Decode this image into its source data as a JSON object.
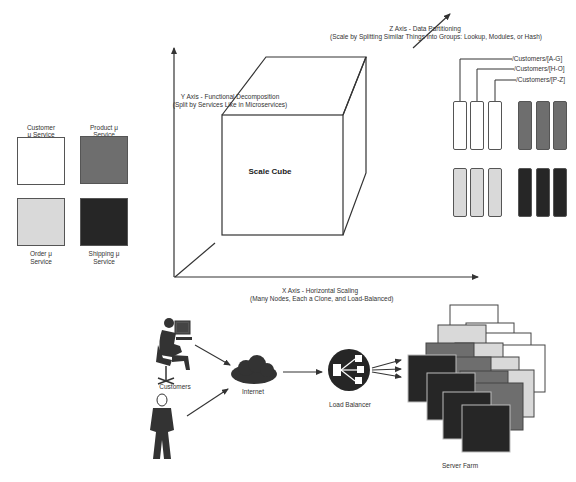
{
  "diagram": {
    "title": "Scale Cube",
    "axes": {
      "y": {
        "title": "Y Axis - Functional Decomposition",
        "subtitle": "(Split by Services Like in Microservices)"
      },
      "x": {
        "title": "X Axis - Horizontal Scaling",
        "subtitle": "(Many Nodes, Each a Clone, and Load-Balanced)"
      },
      "z": {
        "title": "Z Axis - Data Partitioning",
        "subtitle": "(Scale by Splitting Similar Things into Groups: Lookup, Modules, or Hash)"
      }
    },
    "services": [
      {
        "label_line1": "Customer",
        "label_line2": "μ Service",
        "color": "#ffffff"
      },
      {
        "label_line1": "Product μ",
        "label_line2": "Service",
        "color": "#6e6e6e"
      },
      {
        "label_line1": "Order μ",
        "label_line2": "Service",
        "color": "#d9d9d9"
      },
      {
        "label_line1": "Shipping μ",
        "label_line2": "Service",
        "color": "#262626"
      }
    ],
    "partitions": {
      "labels": [
        "/Customers/[A-G]",
        "/Customers/[H-O]",
        "/Customers/[P-Z]"
      ],
      "groups": [
        {
          "color": "#ffffff"
        },
        {
          "color": "#6e6e6e"
        },
        {
          "color": "#d9d9d9"
        },
        {
          "color": "#262626"
        }
      ]
    },
    "flow": {
      "customers_label": "Customers",
      "internet_label": "Internet",
      "load_balancer_label": "Load Balancer",
      "server_farm_label": "Server Farm"
    },
    "colors": {
      "line": "#333333",
      "white": "#ffffff",
      "light": "#d9d9d9",
      "mid": "#6e6e6e",
      "dark": "#262626"
    }
  }
}
